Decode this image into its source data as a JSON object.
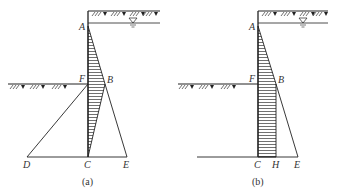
{
  "panels": [
    {
      "id": "a",
      "caption": "(a)",
      "labels": {
        "A": "A",
        "B": "B",
        "C": "C",
        "D": "D",
        "E": "E",
        "F": "F"
      }
    },
    {
      "id": "b",
      "caption": "(b)",
      "labels": {
        "A": "A",
        "B": "B",
        "C": "C",
        "E": "E",
        "F": "F",
        "H": "H"
      }
    }
  ],
  "colors": {
    "line": "#222222",
    "hatch": "#333333",
    "background": "#ffffff"
  }
}
